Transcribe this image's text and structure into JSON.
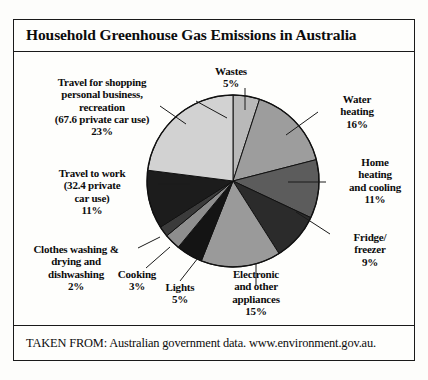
{
  "title": "Household Greenhouse Gas Emissions in Australia",
  "footer": "TAKEN FROM: Australian government data. www.environment.gov.au.",
  "labels": {
    "shopping": "Travel for shopping\npersonal business,\nrecreation\n(67.6 private car use)\n23%",
    "wastes": "Wastes\n5%",
    "water": "Water\nheating\n16%",
    "home": "Home\nheating\nand cooling\n11%",
    "fridge": "Fridge/\nfreezer\n9%",
    "electronic": "Electronic\nand other\nappliances\n15%",
    "lights": "Lights\n5%",
    "cooking": "Cooking\n3%",
    "clothes": "Clothes washing &\ndrying and\ndishwashing\n2%",
    "work": "Travel to work\n(32.4 private\ncar use)\n11%"
  },
  "chart_data": {
    "type": "pie",
    "title": "Household Greenhouse Gas Emissions in Australia",
    "source_note": "TAKEN FROM: Australian government data. www.environment.gov.au.",
    "unit": "percent",
    "total": 100,
    "start_angle_deg": 0,
    "direction": "clockwise",
    "legend": "labels-with-leader-lines",
    "categories": [
      "Wastes",
      "Water heating",
      "Home heating and cooling",
      "Fridge/freezer",
      "Electronic and other appliances",
      "Lights",
      "Cooking",
      "Clothes washing & drying and dishwashing",
      "Travel to work (32.4 private car use)",
      "Travel for shopping personal business, recreation (67.6 private car use)"
    ],
    "values": [
      5,
      16,
      11,
      9,
      15,
      5,
      3,
      2,
      11,
      23
    ],
    "colors": [
      "#b9b9b9",
      "#9d9d9d",
      "#5c5c5c",
      "#2b2b2b",
      "#9a9a9a",
      "#141414",
      "#8e8e8e",
      "#3b3b3b",
      "#1c1c1c",
      "#d2d2d2"
    ],
    "annotations": [
      "67.6 private car use",
      "32.4 private car use"
    ]
  }
}
